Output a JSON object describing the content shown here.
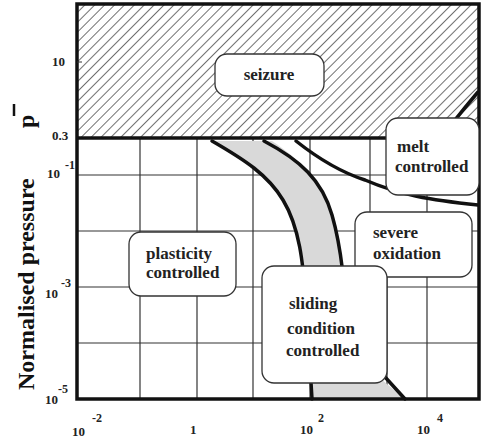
{
  "figure": {
    "type": "wear-mechanism map",
    "y_axis": {
      "label": "Normalised pressure",
      "symbol": "p",
      "ticks": [
        {
          "base": "10",
          "exp": "",
          "label": "10"
        },
        {
          "base": "0.3",
          "exp": "",
          "label": "0.3"
        },
        {
          "base": "10",
          "exp": "-1",
          "label": "10^-1"
        },
        {
          "base": "10",
          "exp": "-3",
          "label": "10^-3"
        },
        {
          "base": "10",
          "exp": "-5",
          "label": "10^-5"
        }
      ]
    },
    "x_axis": {
      "label": "",
      "ticks": [
        {
          "base": "10",
          "exp": "-2",
          "label": "10^-2"
        },
        {
          "base": "1",
          "exp": "",
          "label": "1"
        },
        {
          "base": "10",
          "exp": "2",
          "label": "10^2"
        },
        {
          "base": "10",
          "exp": "4",
          "label": "10^4"
        }
      ]
    },
    "regions": [
      {
        "id": "seizure",
        "lines": [
          "seizure"
        ]
      },
      {
        "id": "melt",
        "lines": [
          "melt",
          "controlled"
        ]
      },
      {
        "id": "oxidation",
        "lines": [
          "severe",
          "oxidation"
        ]
      },
      {
        "id": "plasticity",
        "lines": [
          "plasticity",
          "controlled"
        ]
      },
      {
        "id": "sliding",
        "lines": [
          "sliding",
          "condition",
          "controlled"
        ]
      }
    ],
    "colors": {
      "frame": "#111111",
      "grid": "#333333",
      "band_fill": "#d9d9d9",
      "hatch": "#333333",
      "label_box": "#ffffff"
    }
  }
}
